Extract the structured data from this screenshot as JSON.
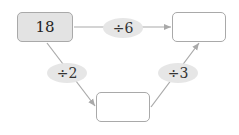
{
  "diagram": {
    "start_box": {
      "value": "18",
      "fill": "#e3e3e3"
    },
    "end_box_top": {
      "value": ""
    },
    "middle_box_bottom": {
      "value": ""
    },
    "operations": {
      "top": "÷6",
      "left": "÷2",
      "right": "÷3"
    },
    "colors": {
      "line": "#a9a9a9",
      "pill": "#e6e6e6"
    }
  }
}
